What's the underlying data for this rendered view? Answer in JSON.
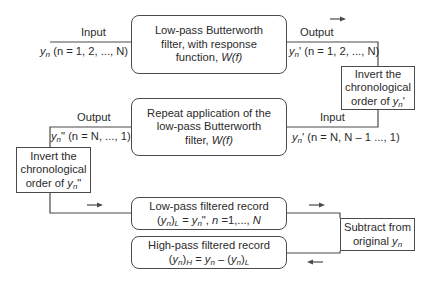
{
  "diagram": {
    "boxes": {
      "lowpass_filter": {
        "line1": "Low-pass Butterworth",
        "line2": "filter, with response",
        "line3_prefix": "function, ",
        "line3_math": "W(f)"
      },
      "repeat_filter": {
        "line1": "Repeat application of the",
        "line2": "low-pass Butterworth",
        "line3_prefix": "filter, ",
        "line3_math": "W(f)"
      },
      "invert_right": {
        "line1": "Invert the",
        "line2": "chronological",
        "line3_prefix": "order of ",
        "var": "y",
        "sub": "n",
        "suffix": "'"
      },
      "invert_left": {
        "line1": "Invert the",
        "line2": "chronological",
        "line3_prefix": "order of ",
        "var": "y",
        "sub": "n",
        "suffix": "\""
      },
      "lowpass_record": {
        "line1": "Low-pass filtered record",
        "eq_lhs_open": "(",
        "var": "y",
        "sub": "n",
        "eq_lhs_close": ")",
        "eq_lhs_sub": "L",
        "eq_rhs": " = y",
        "eq_rhs_sub": "n",
        "eq_rest_a": "\", ",
        "eq_n": "n",
        "eq_rest_b": " =1,..., ",
        "eq_N": "N"
      },
      "highpass_record": {
        "line1": "High-pass filtered record",
        "eq_H": "H",
        "eq_mid": " = ",
        "eq_L": "L"
      },
      "subtract": {
        "line1": "Subtract from",
        "line2_prefix": "original ",
        "var": "y",
        "sub": "n"
      }
    },
    "labels": {
      "input_top": "Input",
      "input_top_series": "(n = 1, 2, ..., N)",
      "output_top": "Output",
      "output_top_series": "' (n = 1, 2, ..., N)",
      "input_mid": "Input",
      "input_mid_series": "' (n = N, N – 1 ..., 1)",
      "output_mid": "Output",
      "output_mid_series": "\" (n = N, ..., 1)"
    },
    "arrows": [
      "right",
      "right",
      "right",
      "left"
    ]
  }
}
